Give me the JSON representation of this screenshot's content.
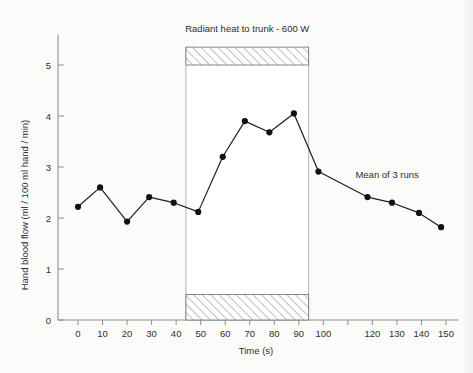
{
  "chart_data": {
    "type": "line",
    "title": "",
    "xlabel": "Time (s)",
    "ylabel": "Hand blood flow (ml / 100 ml hand / min)",
    "xlim": [
      -8,
      155
    ],
    "ylim": [
      0,
      5.6
    ],
    "xticks": [
      0,
      10,
      20,
      30,
      40,
      50,
      60,
      70,
      80,
      90,
      100,
      110,
      120,
      130,
      140,
      150
    ],
    "xticklabels": [
      "0",
      "10",
      "20",
      "30",
      "40",
      "50",
      "60",
      "70",
      "80",
      "90",
      "100",
      "",
      "120",
      "130",
      "140",
      "150"
    ],
    "yticks": [
      0,
      1,
      2,
      3,
      4,
      5
    ],
    "yticklabels": [
      "0",
      "1",
      "2",
      "3",
      "4",
      "5"
    ],
    "grid": false,
    "legend": null,
    "series": [
      {
        "name": "Hand blood flow",
        "marker": "filled-circle",
        "x": [
          0,
          9,
          20,
          29,
          39,
          49,
          59,
          68,
          78,
          88,
          98,
          118,
          128,
          139,
          148
        ],
        "y": [
          2.22,
          2.6,
          1.93,
          2.41,
          2.3,
          2.12,
          3.2,
          3.9,
          3.68,
          4.05,
          2.91,
          2.41,
          2.3,
          2.1,
          1.82
        ]
      }
    ],
    "spans": [
      {
        "name": "heating-period",
        "x_start": 44,
        "x_end": 94,
        "label": "Radiant heat to trunk - 600 W",
        "top_bar": {
          "y_bottom": 5.0,
          "y_top": 5.35,
          "fill": "hatched"
        },
        "bottom_bar": {
          "y_bottom": 0.0,
          "y_top": 0.5,
          "fill": "hatched"
        }
      }
    ],
    "annotations": [
      {
        "name": "heating-label",
        "text": "Radiant heat to trunk - 600 W",
        "x": 69,
        "y": 5.65
      },
      {
        "name": "mean-runs-label",
        "text": "Mean of 3 runs",
        "x": 126,
        "y": 2.78
      }
    ],
    "colors": {
      "line": "#1e1e1e",
      "marker": "#111111",
      "axis": "#8d8d8d",
      "band_edge": "#b4b4b4",
      "hatch": "#7a7a7a",
      "background": "#fbfbf9",
      "text": "#2e2e2e"
    }
  }
}
